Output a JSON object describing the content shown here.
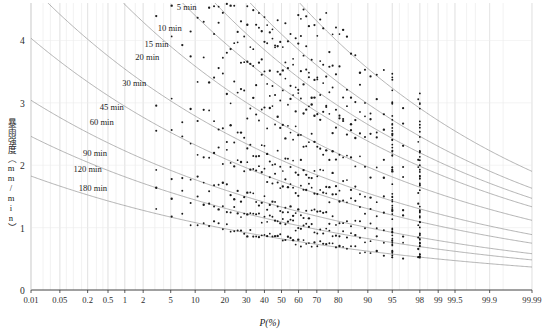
{
  "chart_data": {
    "type": "scatter",
    "title": "",
    "xlabel": "P(%)",
    "ylabel": "暴雨强度（mm/min）",
    "x_scale": "normal-probability",
    "xlim": [
      0.01,
      99.99
    ],
    "ylim": [
      0,
      4.6
    ],
    "grid": true,
    "legend_position": "inline-curve-labels",
    "xticks": [
      "0.01",
      "0.05",
      "0.2",
      "0.5",
      "1",
      "2",
      "5",
      "10",
      "20",
      "30",
      "40",
      "50",
      "60",
      "70",
      "80",
      "90",
      "95",
      "98",
      "99",
      "99.5",
      "99.9",
      "99.99"
    ],
    "xtick_values": [
      0.01,
      0.05,
      0.2,
      0.5,
      1,
      2,
      5,
      10,
      20,
      30,
      40,
      50,
      60,
      70,
      80,
      90,
      95,
      98,
      99,
      99.5,
      99.9,
      99.99
    ],
    "yticks": [
      "0",
      "1",
      "2",
      "3",
      "4"
    ],
    "ytick_values": [
      0,
      1,
      2,
      3,
      4
    ],
    "annotations": [
      {
        "label": "5 min",
        "x_pct": 6.0,
        "y": 4.52
      },
      {
        "label": "10 min",
        "x_pct": 3.3,
        "y": 4.18
      },
      {
        "label": "15 min",
        "x_pct": 2.1,
        "y": 3.93
      },
      {
        "label": "20 min",
        "x_pct": 1.5,
        "y": 3.72
      },
      {
        "label": "30 min",
        "x_pct": 0.9,
        "y": 3.3
      },
      {
        "label": "45 min",
        "x_pct": 0.35,
        "y": 2.92
      },
      {
        "label": "60 min",
        "x_pct": 0.22,
        "y": 2.68
      },
      {
        "label": "90 min",
        "x_pct": 0.16,
        "y": 2.18
      },
      {
        "label": "120 min",
        "x_pct": 0.1,
        "y": 1.92
      },
      {
        "label": "180 min",
        "x_pct": 0.13,
        "y": 1.62
      }
    ],
    "series": [
      {
        "name": "5 min",
        "duration_min": 5,
        "a": 4.93,
        "b": -0.47,
        "y_at": [
          {
            "p": 0.01,
            "i": 5.95
          },
          {
            "p": 1,
            "i": 4.72
          },
          {
            "p": 10,
            "i": 3.68
          },
          {
            "p": 50,
            "i": 2.62
          },
          {
            "p": 90,
            "i": 1.7
          },
          {
            "p": 99,
            "i": 1.14
          },
          {
            "p": 99.99,
            "i": 0.82
          }
        ]
      },
      {
        "name": "10 min",
        "duration_min": 10,
        "a": 4.1,
        "b": -0.455,
        "y_at": [
          {
            "p": 0.01,
            "i": 5.2
          },
          {
            "p": 1,
            "i": 4.06
          },
          {
            "p": 10,
            "i": 3.12
          },
          {
            "p": 50,
            "i": 2.18
          },
          {
            "p": 90,
            "i": 1.4
          },
          {
            "p": 99,
            "i": 0.95
          },
          {
            "p": 99.99,
            "i": 0.7
          }
        ]
      },
      {
        "name": "15 min",
        "duration_min": 15,
        "a": 3.62,
        "b": -0.445,
        "y_at": [
          {
            "p": 0.01,
            "i": 4.78
          },
          {
            "p": 1,
            "i": 3.68
          },
          {
            "p": 10,
            "i": 2.8
          },
          {
            "p": 50,
            "i": 1.93
          },
          {
            "p": 90,
            "i": 1.24
          },
          {
            "p": 99,
            "i": 0.85
          },
          {
            "p": 99.99,
            "i": 0.63
          }
        ]
      },
      {
        "name": "20 min",
        "duration_min": 20,
        "a": 3.24,
        "b": -0.438,
        "y_at": [
          {
            "p": 0.01,
            "i": 4.44
          },
          {
            "p": 1,
            "i": 3.38
          },
          {
            "p": 10,
            "i": 2.54
          },
          {
            "p": 50,
            "i": 1.74
          },
          {
            "p": 90,
            "i": 1.12
          },
          {
            "p": 99,
            "i": 0.77
          },
          {
            "p": 99.99,
            "i": 0.57
          }
        ]
      },
      {
        "name": "30 min",
        "duration_min": 30,
        "a": 2.66,
        "b": -0.428,
        "y_at": [
          {
            "p": 0.01,
            "i": 3.84
          },
          {
            "p": 1,
            "i": 2.88
          },
          {
            "p": 10,
            "i": 2.12
          },
          {
            "p": 50,
            "i": 1.44
          },
          {
            "p": 90,
            "i": 0.93
          },
          {
            "p": 99,
            "i": 0.64
          },
          {
            "p": 99.99,
            "i": 0.48
          }
        ]
      },
      {
        "name": "45 min",
        "duration_min": 45,
        "a": 2.08,
        "b": -0.42,
        "y_at": [
          {
            "p": 0.01,
            "i": 3.14
          },
          {
            "p": 1,
            "i": 2.3
          },
          {
            "p": 10,
            "i": 1.68
          },
          {
            "p": 50,
            "i": 1.14
          },
          {
            "p": 90,
            "i": 0.74
          },
          {
            "p": 99,
            "i": 0.51
          },
          {
            "p": 99.99,
            "i": 0.39
          }
        ]
      },
      {
        "name": "60 min",
        "duration_min": 60,
        "a": 1.74,
        "b": -0.415,
        "y_at": [
          {
            "p": 0.01,
            "i": 2.74
          },
          {
            "p": 1,
            "i": 1.97
          },
          {
            "p": 10,
            "i": 1.43
          },
          {
            "p": 50,
            "i": 0.97
          },
          {
            "p": 90,
            "i": 0.63
          },
          {
            "p": 99,
            "i": 0.44
          },
          {
            "p": 99.99,
            "i": 0.33
          }
        ]
      },
      {
        "name": "90 min",
        "duration_min": 90,
        "a": 1.33,
        "b": -0.408,
        "y_at": [
          {
            "p": 0.01,
            "i": 2.2
          },
          {
            "p": 1,
            "i": 1.53
          },
          {
            "p": 10,
            "i": 1.1
          },
          {
            "p": 50,
            "i": 0.75
          },
          {
            "p": 90,
            "i": 0.49
          },
          {
            "p": 99,
            "i": 0.35
          },
          {
            "p": 99.99,
            "i": 0.26
          }
        ]
      },
      {
        "name": "120 min",
        "duration_min": 120,
        "a": 1.09,
        "b": -0.402,
        "y_at": [
          {
            "p": 0.01,
            "i": 1.88
          },
          {
            "p": 1,
            "i": 1.27
          },
          {
            "p": 10,
            "i": 0.91
          },
          {
            "p": 50,
            "i": 0.62
          },
          {
            "p": 90,
            "i": 0.41
          },
          {
            "p": 99,
            "i": 0.29
          },
          {
            "p": 99.99,
            "i": 0.22
          }
        ]
      },
      {
        "name": "180 min",
        "duration_min": 180,
        "a": 0.82,
        "b": -0.395,
        "y_at": [
          {
            "p": 0.01,
            "i": 1.52
          },
          {
            "p": 1,
            "i": 0.98
          },
          {
            "p": 10,
            "i": 0.7
          },
          {
            "p": 50,
            "i": 0.47
          },
          {
            "p": 90,
            "i": 0.31
          },
          {
            "p": 99,
            "i": 0.22
          },
          {
            "p": 99.99,
            "i": 0.17
          }
        ]
      }
    ],
    "observed_points_note": "scatter of observed annual maxima plotted at empirical frequencies"
  },
  "axes": {
    "x_title": "P(%)",
    "y_title": "暴雨强度（mm/min）"
  }
}
